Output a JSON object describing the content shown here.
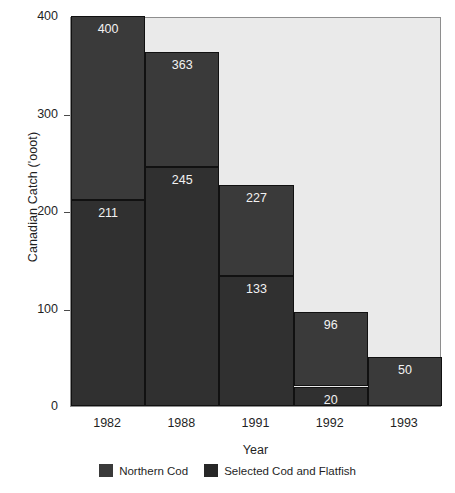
{
  "chart_data": {
    "type": "bar",
    "title": "",
    "xlabel": "Year",
    "ylabel": "Canadian Catch ('ooot)",
    "categories": [
      "1982",
      "1988",
      "1991",
      "1992",
      "1993"
    ],
    "ylim": [
      0,
      400
    ],
    "yticks": [
      0,
      100,
      200,
      300,
      400
    ],
    "ytick_labels": [
      "0",
      "100",
      "200",
      "300",
      "400"
    ],
    "grid": false,
    "legend_position": "bottom",
    "series": [
      {
        "name": "Northern Cod",
        "color": "#303030",
        "values": [
          211,
          245,
          133,
          20,
          0
        ]
      },
      {
        "name": "Selected Cod and Flatfish",
        "color": "#3a3a3a",
        "values": [
          400,
          363,
          227,
          96,
          50
        ]
      }
    ],
    "bars": [
      {
        "category": "1982",
        "total": 400,
        "total_label": "400",
        "lower": 211,
        "lower_label": "211"
      },
      {
        "category": "1988",
        "total": 363,
        "total_label": "363",
        "lower": 245,
        "lower_label": "245"
      },
      {
        "category": "1991",
        "total": 227,
        "total_label": "227",
        "lower": 133,
        "lower_label": "133"
      },
      {
        "category": "1992",
        "total": 96,
        "total_label": "96",
        "lower": 20,
        "lower_label": "20"
      },
      {
        "category": "1993",
        "total": 50,
        "total_label": "50",
        "lower": null,
        "lower_label": ""
      }
    ],
    "legend": [
      {
        "label": "Northern Cod",
        "color": "#3a3a3a"
      },
      {
        "label": "Selected Cod and Flatfish",
        "color": "#272727"
      }
    ],
    "colors": {
      "plot_background": "#eaeaea",
      "bar_upper": "#3a3a3a",
      "bar_lower": "#303030",
      "axis": "#8e8e8e",
      "text": "#1f1f1f",
      "value_text": "#f2f2f2"
    }
  }
}
